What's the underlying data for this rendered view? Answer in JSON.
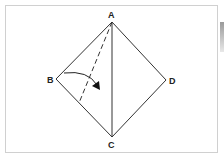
{
  "diagram": {
    "type": "fold-diagram",
    "labels": {
      "A": "A",
      "B": "B",
      "C": "C",
      "D": "D"
    },
    "vertices": {
      "A": [
        112,
        22
      ],
      "B": [
        56,
        79
      ],
      "C": [
        112,
        137
      ],
      "D": [
        166,
        80
      ]
    },
    "fold_line": "dashed line from A to edge BC",
    "arrow": "curved arrow folding corner B toward the center line",
    "colors": {
      "stroke": "#333333",
      "frame": "#d0d0d0"
    }
  }
}
